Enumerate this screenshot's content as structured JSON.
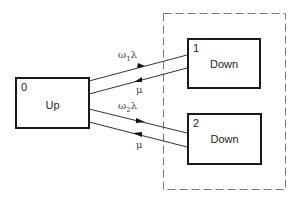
{
  "diagram": {
    "nodes": [
      {
        "id": "0",
        "number": "0",
        "label": "Up"
      },
      {
        "id": "1",
        "number": "1",
        "label": "Down"
      },
      {
        "id": "2",
        "number": "2",
        "label": "Down"
      }
    ],
    "group": {
      "style": "dashed",
      "contains": [
        "1",
        "2"
      ]
    },
    "edges": [
      {
        "from": "0",
        "to": "1",
        "label": "ω1λ",
        "label_base": "ω",
        "label_sub": "1",
        "label_tail": "λ"
      },
      {
        "from": "1",
        "to": "0",
        "label": "μ"
      },
      {
        "from": "0",
        "to": "2",
        "label": "ω2λ",
        "label_base": "ω",
        "label_sub": "2",
        "label_tail": "λ"
      },
      {
        "from": "2",
        "to": "0",
        "label": "μ"
      }
    ]
  }
}
